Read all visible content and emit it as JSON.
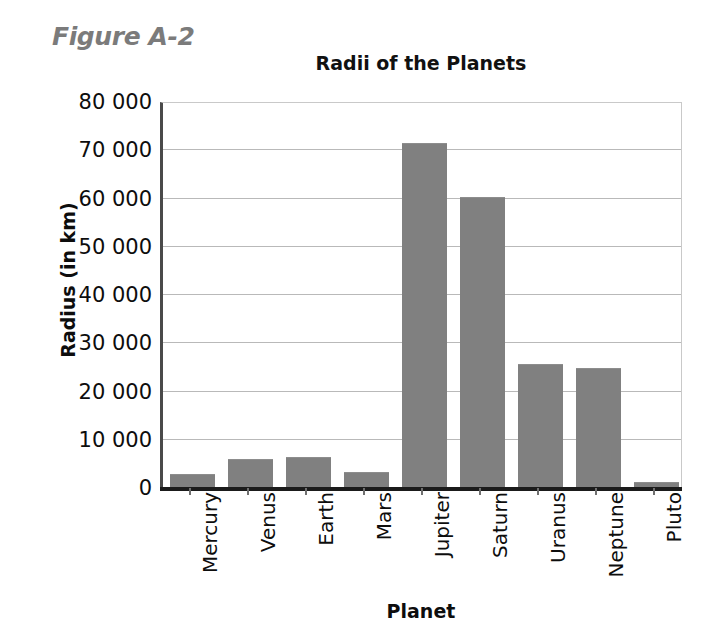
{
  "figure": {
    "label": "Figure A-2",
    "label_color": "#7b7b7b"
  },
  "chart_data": {
    "type": "bar",
    "title": "Radii of the Planets",
    "xlabel": "Planet",
    "ylabel": "Radius (in km)",
    "categories": [
      "Mercury",
      "Venus",
      "Earth",
      "Mars",
      "Jupiter",
      "Saturn",
      "Uranus",
      "Neptune",
      "Pluto"
    ],
    "values": [
      2900,
      6050,
      6380,
      3400,
      71500,
      60300,
      25600,
      24800,
      1150
    ],
    "ylim": [
      0,
      80000
    ],
    "ytick_values": [
      0,
      10000,
      20000,
      30000,
      40000,
      50000,
      60000,
      70000,
      80000
    ],
    "ytick_labels": [
      "0",
      "10 000",
      "20 000",
      "30 000",
      "40 000",
      "50 000",
      "60 000",
      "70 000",
      "80 000"
    ],
    "grid": true,
    "legend": false,
    "bar_color": "#808080",
    "axis_color": "#1b1b1b",
    "gridline_color": "#b9b9b9",
    "xtick_rotation": -90
  }
}
